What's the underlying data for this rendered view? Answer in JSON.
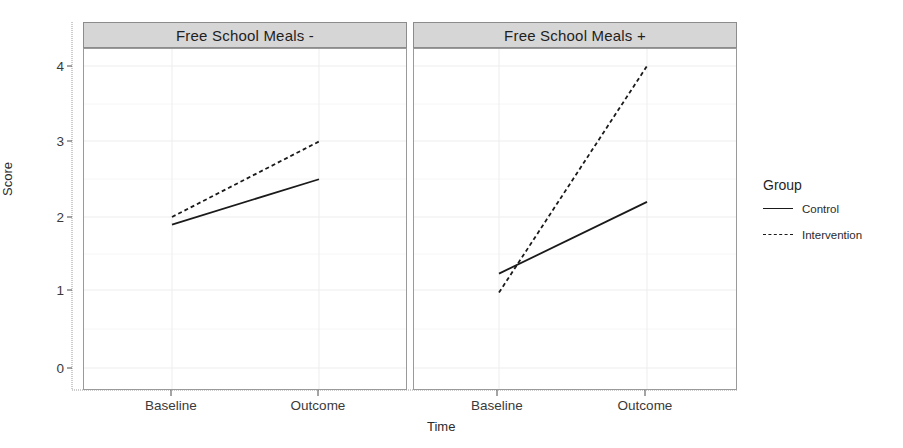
{
  "chart_data": {
    "type": "line",
    "title": "",
    "xlabel": "Time",
    "ylabel": "Score",
    "categories": [
      "Baseline",
      "Outcome"
    ],
    "ylim": [
      0,
      4.2
    ],
    "yticks": [
      0,
      1,
      2,
      3,
      4
    ],
    "ytick_labels": [
      "0",
      "1",
      "2",
      "3",
      "4"
    ],
    "grid": true,
    "legend_position": "right",
    "legend_title": "Group",
    "facets": [
      {
        "label": "Free School Meals -",
        "series": [
          {
            "name": "Control",
            "linestyle": "solid",
            "values": [
              1.9,
              2.5
            ]
          },
          {
            "name": "Intervention",
            "linestyle": "dashed",
            "values": [
              2.0,
              3.0
            ]
          }
        ]
      },
      {
        "label": "Free School Meals +",
        "series": [
          {
            "name": "Control",
            "linestyle": "solid",
            "values": [
              1.25,
              2.2
            ]
          },
          {
            "name": "Intervention",
            "linestyle": "dashed",
            "values": [
              1.0,
              4.0
            ]
          }
        ]
      }
    ],
    "legend_entries": [
      {
        "name": "Control",
        "linestyle": "solid"
      },
      {
        "name": "Intervention",
        "linestyle": "dashed"
      }
    ],
    "colors": {
      "line": "#1a1a1a",
      "grid": "#ededed",
      "panel_border": "#9a9a9a",
      "strip_background": "#d6d6d6",
      "strip_border": "#8c8c8c",
      "background": "#ffffff"
    }
  }
}
